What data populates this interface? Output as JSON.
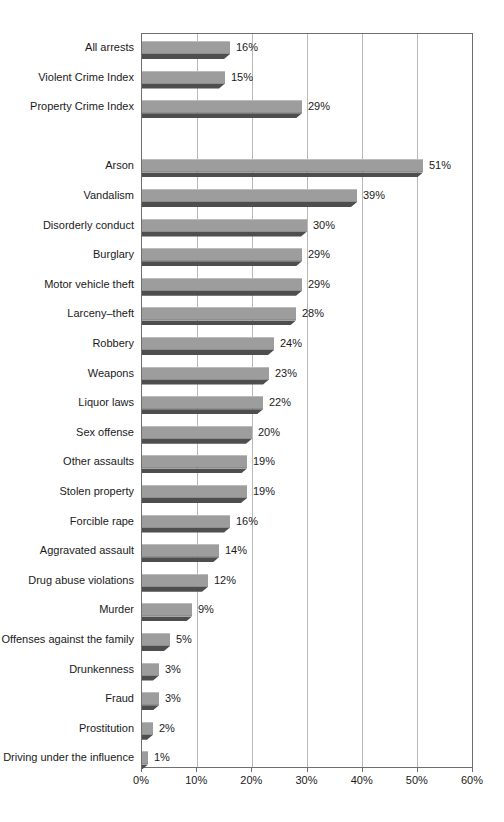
{
  "chart_data": {
    "type": "bar",
    "orientation": "horizontal",
    "title": "",
    "xlabel": "",
    "ylabel": "",
    "xlim": [
      0,
      60
    ],
    "grid": "vertical",
    "unit": "percent",
    "x_ticks": [
      {
        "value": 0,
        "label": "0%"
      },
      {
        "value": 10,
        "label": "10%"
      },
      {
        "value": 20,
        "label": "20%"
      },
      {
        "value": 30,
        "label": "30%"
      },
      {
        "value": 40,
        "label": "40%"
      },
      {
        "value": 50,
        "label": "50%"
      },
      {
        "value": 60,
        "label": "60%"
      }
    ],
    "rows": [
      {
        "label": "All arrests",
        "value": 16,
        "value_label": "16%"
      },
      {
        "label": "Violent Crime Index",
        "value": 15,
        "value_label": "15%"
      },
      {
        "label": "Property Crime Index",
        "value": 29,
        "value_label": "29%"
      },
      {
        "spacer": true
      },
      {
        "label": "Arson",
        "value": 51,
        "value_label": "51%"
      },
      {
        "label": "Vandalism",
        "value": 39,
        "value_label": "39%"
      },
      {
        "label": "Disorderly conduct",
        "value": 30,
        "value_label": "30%"
      },
      {
        "label": "Burglary",
        "value": 29,
        "value_label": "29%"
      },
      {
        "label": "Motor vehicle theft",
        "value": 29,
        "value_label": "29%"
      },
      {
        "label": "Larceny–theft",
        "value": 28,
        "value_label": "28%"
      },
      {
        "label": "Robbery",
        "value": 24,
        "value_label": "24%"
      },
      {
        "label": "Weapons",
        "value": 23,
        "value_label": "23%"
      },
      {
        "label": "Liquor laws",
        "value": 22,
        "value_label": "22%"
      },
      {
        "label": "Sex offense",
        "value": 20,
        "value_label": "20%"
      },
      {
        "label": "Other assaults",
        "value": 19,
        "value_label": "19%"
      },
      {
        "label": "Stolen property",
        "value": 19,
        "value_label": "19%"
      },
      {
        "label": "Forcible rape",
        "value": 16,
        "value_label": "16%"
      },
      {
        "label": "Aggravated assault",
        "value": 14,
        "value_label": "14%"
      },
      {
        "label": "Drug abuse violations",
        "value": 12,
        "value_label": "12%"
      },
      {
        "label": "Murder",
        "value": 9,
        "value_label": "9%"
      },
      {
        "label": "Offenses against the family",
        "value": 5,
        "value_label": "5%"
      },
      {
        "label": "Drunkenness",
        "value": 3,
        "value_label": "3%"
      },
      {
        "label": "Fraud",
        "value": 3,
        "value_label": "3%"
      },
      {
        "label": "Prostitution",
        "value": 2,
        "value_label": "2%"
      },
      {
        "label": "Driving under the influence",
        "value": 1,
        "value_label": "1%"
      }
    ]
  },
  "colors": {
    "bar_body": "#9d9d9d",
    "bar_highlight": "#bcbcbc",
    "bar_shadow": "#4e4e4e",
    "gridline": "#b9b9b9",
    "frame": "#6f6f6f",
    "text": "#1a1a1a",
    "background": "#ffffff"
  }
}
